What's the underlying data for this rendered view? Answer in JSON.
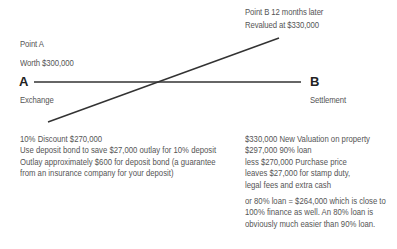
{
  "point_a": {
    "title": "Point A",
    "value": "Worth $300,000",
    "marker": "A",
    "event": "Exchange"
  },
  "point_b": {
    "title": "Point B 12 months later",
    "value": "Revalued at $330,000",
    "marker": "B",
    "event": "Settlement"
  },
  "left_notes": [
    "10% Discount $270,000",
    "Use deposit bond to save $27,000 outlay for 10% deposit",
    "Outlay approximately $600 for deposit bond (a guarantee",
    "from an insurance company for your deposit)"
  ],
  "right_notes": [
    "$330,000 New Valuation on property",
    "$297,000 90% loan",
    "less $270,000 Purchase price",
    "leaves $27,000 for stamp duty,",
    "legal fees and extra cash"
  ],
  "right_notes_2": [
    "or 80% loan = $264,000 which is close to",
    "100% finance as well. An 80% loan is",
    "obviously much easier than 90% loan."
  ],
  "colors": {
    "line": "#333333",
    "text": "#555555",
    "marker": "#222222"
  }
}
